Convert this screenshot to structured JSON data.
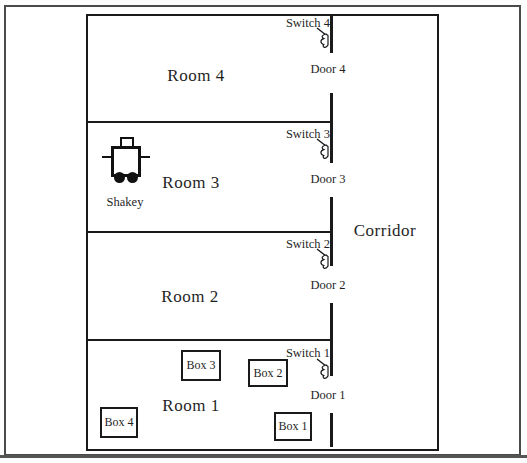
{
  "rooms": [
    {
      "label": "Room 4"
    },
    {
      "label": "Room 3"
    },
    {
      "label": "Room 2"
    },
    {
      "label": "Room 1"
    }
  ],
  "corridor": {
    "label": "Corridor"
  },
  "switches": [
    {
      "label": "Switch 4"
    },
    {
      "label": "Switch 3"
    },
    {
      "label": "Switch 2"
    },
    {
      "label": "Switch 1"
    }
  ],
  "doors": [
    {
      "label": "Door 4"
    },
    {
      "label": "Door 3"
    },
    {
      "label": "Door 2"
    },
    {
      "label": "Door 1"
    }
  ],
  "boxes": [
    {
      "label": "Box 3"
    },
    {
      "label": "Box 2"
    },
    {
      "label": "Box 4"
    },
    {
      "label": "Box 1"
    }
  ],
  "robot": {
    "label": "Shakey"
  },
  "colors": {
    "wall": "#1a1a1a",
    "text": "#1f1f1f",
    "frame": "#4a4a4a",
    "background": "#ffffff"
  }
}
